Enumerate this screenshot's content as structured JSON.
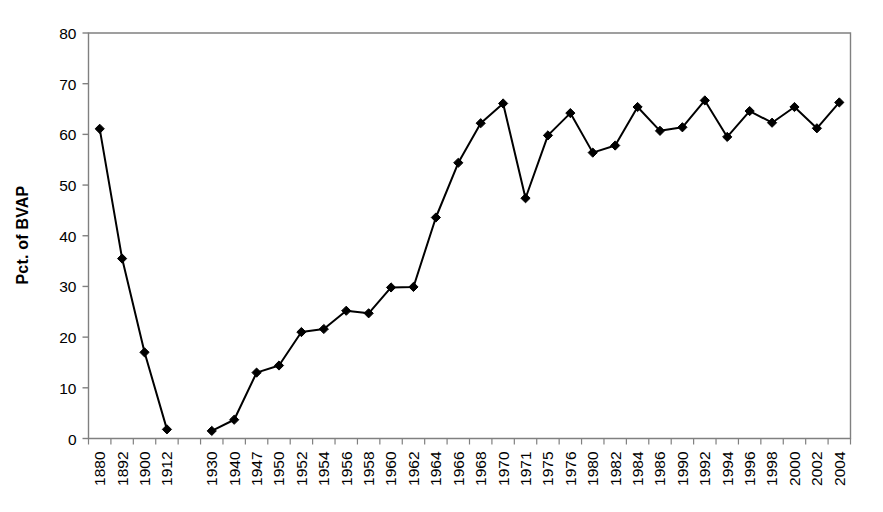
{
  "chart_data": {
    "type": "line",
    "title": "",
    "xlabel": "",
    "ylabel": "Pct. of BVAP",
    "ylim": [
      0,
      80
    ],
    "ytick_step": 10,
    "yticks": [
      0,
      10,
      20,
      30,
      40,
      50,
      60,
      70,
      80
    ],
    "grid": false,
    "legend": "none",
    "marker": "diamond",
    "line_color": "#000000",
    "marker_color": "#000000",
    "axis_color": "#808080",
    "categories": [
      "1880",
      "1892",
      "1900",
      "1912",
      "",
      "1930",
      "1940",
      "1947",
      "1950",
      "1952",
      "1954",
      "1956",
      "1958",
      "1960",
      "1962",
      "1964",
      "1966",
      "1968",
      "1970",
      "1971",
      "1975",
      "1976",
      "1980",
      "1982",
      "1984",
      "1986",
      "1990",
      "1992",
      "1994",
      "1996",
      "1998",
      "2000",
      "2002",
      "2004"
    ],
    "values": [
      61.1,
      35.5,
      17.0,
      1.8,
      null,
      1.5,
      3.7,
      13.0,
      14.4,
      21.0,
      21.6,
      25.2,
      24.7,
      29.8,
      29.9,
      43.6,
      54.4,
      62.2,
      66.1,
      47.4,
      59.8,
      64.2,
      56.4,
      57.8,
      65.4,
      60.7,
      61.4,
      66.7,
      59.5,
      64.6,
      62.3,
      65.4,
      61.2,
      66.3
    ],
    "series": [
      {
        "name": "Pct. of BVAP",
        "values": [
          61.1,
          35.5,
          17.0,
          1.8,
          null,
          1.5,
          3.7,
          13.0,
          14.4,
          21.0,
          21.6,
          25.2,
          24.7,
          29.8,
          29.9,
          43.6,
          54.4,
          62.2,
          66.1,
          47.4,
          59.8,
          64.2,
          56.4,
          57.8,
          65.4,
          60.7,
          61.4,
          66.7,
          59.5,
          64.6,
          62.3,
          65.4,
          61.2,
          66.3
        ]
      }
    ]
  },
  "axes": {
    "y_title": "Pct. of BVAP",
    "y_labels": [
      "80",
      "70",
      "60",
      "50",
      "40",
      "30",
      "20",
      "10",
      "0"
    ],
    "x_labels": [
      "1880",
      "1892",
      "1900",
      "1912",
      "",
      "1930",
      "1940",
      "1947",
      "1950",
      "1952",
      "1954",
      "1956",
      "1958",
      "1960",
      "1962",
      "1964",
      "1966",
      "1968",
      "1970",
      "1971",
      "1975",
      "1976",
      "1980",
      "1982",
      "1984",
      "1986",
      "1990",
      "1992",
      "1994",
      "1996",
      "1998",
      "2000",
      "2002",
      "2004"
    ]
  }
}
